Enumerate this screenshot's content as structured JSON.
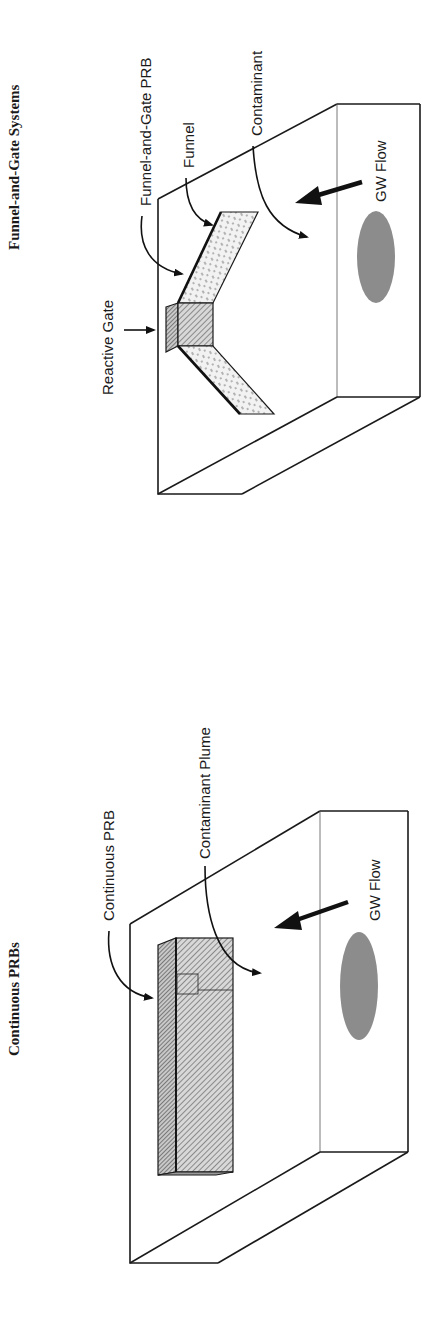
{
  "figure": {
    "orientation": "rotated 90deg counter-clockwise (landscape page)",
    "panels": [
      {
        "id": "funnel-and-gate",
        "title": "Funnel-and-Gate Systems",
        "labels": {
          "reactive_gate": "Reactive Gate",
          "funnel_and_gate_prb": "Funnel-and-Gate PRB",
          "funnel": "Funnel",
          "contaminant": "Contaminant",
          "gw_flow": "GW Flow"
        }
      },
      {
        "id": "continuous-prb",
        "title": "Continuous PRBs",
        "labels": {
          "continuous_prb": "Continuous PRB",
          "contaminant_plume": "Contaminant Plume",
          "gw_flow": "GW Flow"
        }
      }
    ],
    "colors": {
      "line": "#1a1a1a",
      "plume": "#8c8c8c",
      "funnel_fill": "#e6e6e6",
      "gate_fill": "#b5b5b5",
      "barrier_fill": "#bdbdbd",
      "background": "#ffffff"
    }
  }
}
